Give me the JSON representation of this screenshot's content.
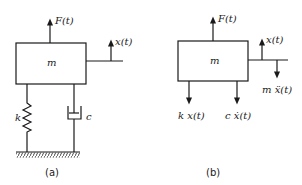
{
  "diagram": {
    "colors": {
      "ink": "#1a1a1a",
      "background": "#ffffff"
    },
    "panel_a": {
      "caption": "(a)",
      "mass_label": "m",
      "force_label": "F(t)",
      "displacement_label": "x(t)",
      "spring_label": "k",
      "damper_label": "c"
    },
    "panel_b": {
      "caption": "(b)",
      "mass_label": "m",
      "force_label": "F(t)",
      "displacement_label": "x(t)",
      "inertia_label": "m ẍ(t)",
      "spring_force_label": "k x(t)",
      "damper_force_label": "c ẋ(t)"
    }
  }
}
